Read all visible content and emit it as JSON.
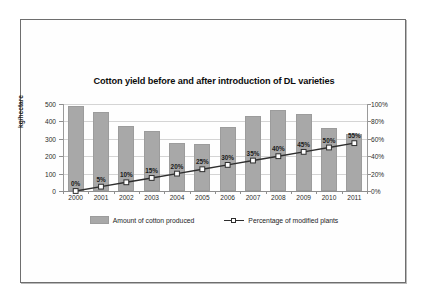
{
  "chart_data": {
    "type": "bar",
    "title": "Cotton yield before and after introduction of DL varieties",
    "categories": [
      "2000",
      "2001",
      "2002",
      "2003",
      "2004",
      "2005",
      "2006",
      "2007",
      "2008",
      "2009",
      "2010",
      "2011"
    ],
    "xlabel": "",
    "ylabel": "kg/hectare",
    "ylim": [
      0,
      500
    ],
    "y_ticks": [
      "0",
      "100",
      "200",
      "300",
      "400",
      "500"
    ],
    "y2label": "",
    "y2lim": [
      0,
      100
    ],
    "y2_ticks": [
      "0%",
      "20%",
      "40%",
      "60%",
      "80%",
      "100%"
    ],
    "grid": true,
    "legend_position": "bottom",
    "series": [
      {
        "name": "Amount of cotton produced",
        "type": "bar",
        "axis": "left",
        "color": "#a8a8a8",
        "values": [
          490,
          455,
          375,
          343,
          275,
          270,
          370,
          430,
          465,
          440,
          362,
          325
        ]
      },
      {
        "name": "Percentage of modified plants",
        "type": "line",
        "axis": "right",
        "color": "#2e2e2e",
        "marker": "open-square",
        "values": [
          0,
          5,
          10,
          15,
          20,
          25,
          30,
          35,
          40,
          45,
          50,
          55
        ],
        "data_labels": [
          "0%",
          "5%",
          "10%",
          "15%",
          "20%",
          "25%",
          "30%",
          "35%",
          "40%",
          "45%",
          "50%",
          "55%"
        ]
      }
    ]
  },
  "legend": {
    "bar_label": "Amount of cotton produced",
    "line_label": "Percentage of modified plants"
  }
}
